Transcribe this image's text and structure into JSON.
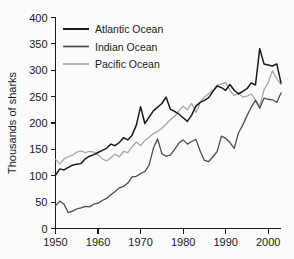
{
  "chart_data": {
    "type": "line",
    "title": "",
    "xlabel": "",
    "ylabel": "Thousands of sharks",
    "xlim": [
      1950,
      2003
    ],
    "ylim": [
      0,
      400
    ],
    "grid": false,
    "legend_position": "top-left",
    "xticks": [
      1950,
      1960,
      1970,
      1980,
      1990,
      2000
    ],
    "xtick_labels": [
      "1950",
      "1960",
      "1970",
      "1980",
      "1990",
      "2000"
    ],
    "yticks": [
      0,
      50,
      100,
      150,
      200,
      250,
      300,
      350,
      400
    ],
    "ytick_labels": [
      "0",
      "50",
      "100",
      "150",
      "200",
      "250",
      "300",
      "350",
      "400"
    ],
    "x": [
      1950,
      1951,
      1952,
      1953,
      1954,
      1955,
      1956,
      1957,
      1958,
      1959,
      1960,
      1961,
      1962,
      1963,
      1964,
      1965,
      1966,
      1967,
      1968,
      1969,
      1970,
      1971,
      1972,
      1973,
      1974,
      1975,
      1976,
      1977,
      1978,
      1979,
      1980,
      1981,
      1982,
      1983,
      1984,
      1985,
      1986,
      1987,
      1988,
      1989,
      1990,
      1991,
      1992,
      1993,
      1994,
      1995,
      1996,
      1997,
      1998,
      1999,
      2000,
      2001,
      2002,
      2003
    ],
    "series": [
      {
        "name": "Atlantic Ocean",
        "color": "#1a1a1a",
        "values": [
          101,
          113,
          111,
          116,
          120,
          122,
          123,
          132,
          137,
          140,
          144,
          148,
          152,
          160,
          157,
          163,
          172,
          168,
          177,
          196,
          231,
          199,
          211,
          223,
          230,
          237,
          249,
          226,
          222,
          217,
          210,
          203,
          215,
          232,
          239,
          243,
          248,
          260,
          270,
          267,
          262,
          273,
          262,
          255,
          260,
          265,
          276,
          272,
          341,
          312,
          310,
          308,
          312,
          276
        ]
      },
      {
        "name": "Indian Ocean",
        "color": "#4d4d4d",
        "values": [
          43,
          52,
          46,
          30,
          33,
          37,
          39,
          42,
          41,
          46,
          48,
          53,
          57,
          64,
          70,
          77,
          80,
          86,
          98,
          99,
          104,
          108,
          120,
          152,
          170,
          142,
          137,
          139,
          150,
          162,
          168,
          160,
          165,
          169,
          147,
          129,
          127,
          136,
          146,
          175,
          171,
          163,
          152,
          181,
          196,
          214,
          230,
          243,
          228,
          247,
          245,
          244,
          239,
          257
        ]
      },
      {
        "name": "Pacific Ocean",
        "color": "#a6a6a6",
        "values": [
          131,
          122,
          132,
          136,
          139,
          145,
          147,
          144,
          146,
          145,
          140,
          132,
          128,
          134,
          141,
          136,
          146,
          144,
          155,
          164,
          157,
          167,
          173,
          180,
          184,
          190,
          198,
          206,
          213,
          223,
          232,
          225,
          237,
          220,
          238,
          249,
          256,
          262,
          272,
          274,
          277,
          262,
          252,
          257,
          249,
          251,
          255,
          244,
          231,
          263,
          277,
          299,
          284,
          273
        ]
      }
    ]
  },
  "legend": {
    "entries": [
      {
        "label": "Atlantic Ocean"
      },
      {
        "label": "Indian Ocean"
      },
      {
        "label": "Pacific Ocean"
      }
    ]
  }
}
